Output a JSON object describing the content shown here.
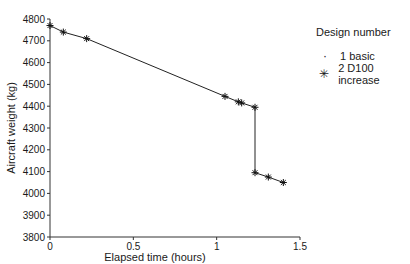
{
  "chart_data": {
    "type": "line",
    "title": "",
    "xlabel": "Elapsed time (hours)",
    "ylabel": "Aircraft weight (kg)",
    "xlim": [
      0,
      1.5
    ],
    "ylim": [
      3800,
      4800
    ],
    "x_ticks": [
      "0",
      "0.5",
      "1",
      "1.5"
    ],
    "y_ticks": [
      "3800",
      "3900",
      "4000",
      "4100",
      "4200",
      "4300",
      "4400",
      "4500",
      "4600",
      "4700",
      "4800"
    ],
    "grid": false,
    "legend_position": "right",
    "legend_title": "Design number",
    "series": [
      {
        "name": "1 basic",
        "marker": "dot",
        "x": [
          0.0,
          0.08,
          0.22,
          1.05,
          1.13,
          1.15,
          1.23,
          1.23,
          1.31,
          1.4
        ],
        "values": [
          4770,
          4740,
          4710,
          4445,
          4420,
          4415,
          4395,
          4095,
          4075,
          4050
        ]
      },
      {
        "name": "2 D100 increase",
        "marker": "asterisk",
        "x": [
          0.0,
          0.08,
          0.22,
          1.05,
          1.13,
          1.15,
          1.23,
          1.23,
          1.31,
          1.4
        ],
        "values": [
          4770,
          4740,
          4710,
          4445,
          4420,
          4415,
          4395,
          4095,
          4075,
          4050
        ]
      }
    ]
  },
  "legend": {
    "title": "Design number",
    "items": [
      {
        "marker": "·",
        "label": "1 basic"
      },
      {
        "marker": "✳",
        "label": "2 D100 increase"
      }
    ]
  }
}
